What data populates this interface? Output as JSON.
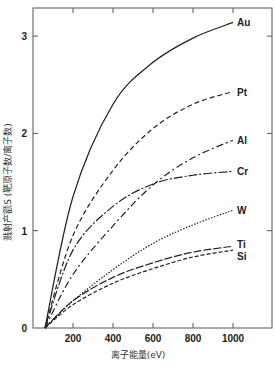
{
  "chart_data": {
    "type": "line",
    "title": "",
    "xlabel": "离子能量(eV)",
    "ylabel": "溅射产额S (靶原子数/离子数)",
    "xlim": [
      0,
      1200
    ],
    "ylim": [
      0,
      3.3
    ],
    "xticks": [
      200,
      400,
      600,
      800,
      1000
    ],
    "yticks": [
      0,
      1,
      2,
      3
    ],
    "grid": false,
    "legend_position": "inline-right",
    "x": [
      60,
      200,
      400,
      600,
      800,
      1000
    ],
    "series": [
      {
        "name": "Au",
        "style": "solid",
        "values": [
          0,
          1.35,
          2.3,
          2.73,
          2.98,
          3.14
        ]
      },
      {
        "name": "Pt",
        "style": "dashed",
        "values": [
          0,
          0.95,
          1.62,
          2.05,
          2.3,
          2.43
        ]
      },
      {
        "name": "Al",
        "style": "dash-dot-long",
        "values": [
          0,
          0.55,
          1.05,
          1.47,
          1.75,
          1.93
        ]
      },
      {
        "name": "Cr",
        "style": "dash-dot",
        "values": [
          0,
          0.8,
          1.25,
          1.48,
          1.57,
          1.61
        ]
      },
      {
        "name": "W",
        "style": "dotted",
        "values": [
          0,
          0.28,
          0.6,
          0.87,
          1.06,
          1.21
        ]
      },
      {
        "name": "Ti",
        "style": "long-dash",
        "values": [
          0,
          0.28,
          0.52,
          0.67,
          0.78,
          0.84
        ]
      },
      {
        "name": "Si",
        "style": "short-dash",
        "values": [
          0,
          0.24,
          0.46,
          0.61,
          0.73,
          0.8
        ]
      }
    ]
  }
}
